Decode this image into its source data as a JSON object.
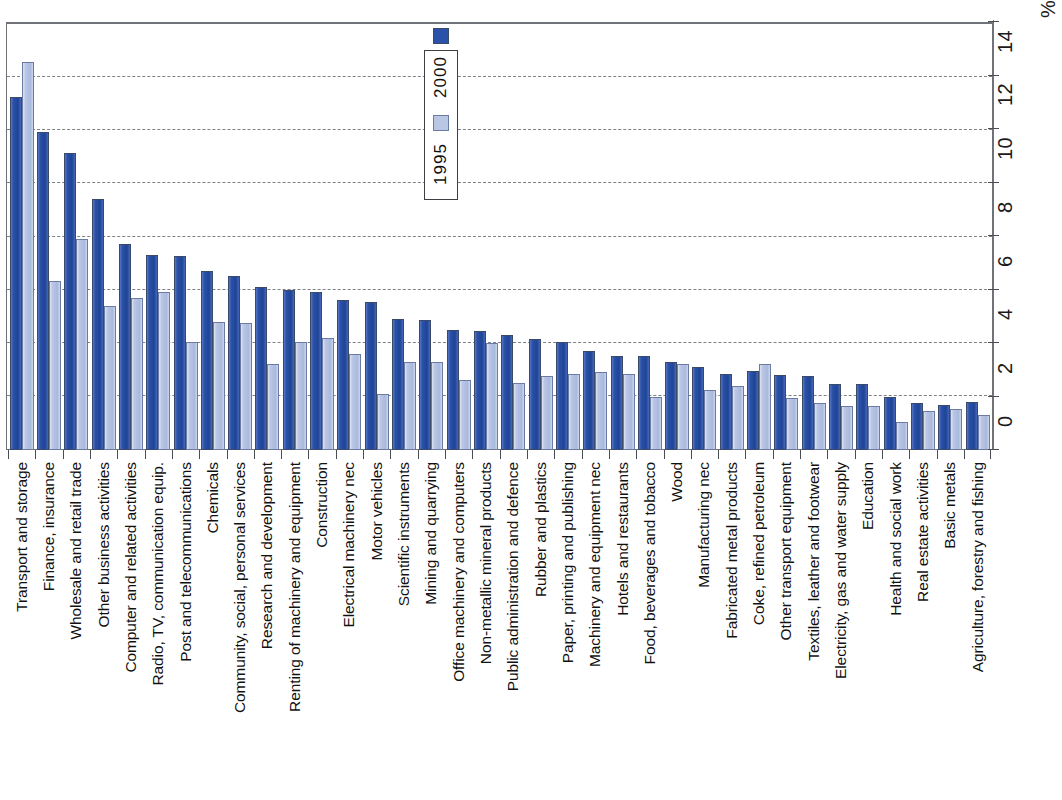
{
  "chart_data": {
    "type": "bar",
    "title": "",
    "subtitle": "",
    "xlabel": "",
    "ylabel": "%",
    "unit_label": "%",
    "ylim": [
      0,
      16
    ],
    "yticks": [
      0,
      2,
      4,
      6,
      8,
      10,
      12,
      14,
      16
    ],
    "grid": true,
    "grid_style": "dashed-horizontal",
    "orientation": "vertical-bars-rotated-labels",
    "legend": {
      "position": "top-center-inside",
      "entries": [
        {
          "name": "1995",
          "color": "#b9c6e4"
        },
        {
          "name": "2000",
          "color": "#2a52a8"
        }
      ]
    },
    "categories": [
      "Transport and storage",
      "Finance, insurance",
      "Wholesale and retail trade",
      "Other business activities",
      "Computer and related activities",
      "Radio, TV, communication equip.",
      "Post and telecommunications",
      "Chemicals",
      "Community, social, personal services",
      "Research and development",
      "Renting of machinery and equipment",
      "Construction",
      "Electrical machinery nec",
      "Motor vehicles",
      "Scientific instruments",
      "Mining and quarrying",
      "Office machinery and computers",
      "Non-metallic mineral products",
      "Public administration and defence",
      "Rubber and plastics",
      "Paper, printing and publishing",
      "Machinery and equipment nec",
      "Hotels and restaurants",
      "Food, beverages and tobacco",
      "Wood",
      "Manufacturing nec",
      "Fabricated metal products",
      "Coke, refined petroleum",
      "Other transport equipment",
      "Textiles, leather and footwear",
      "Electricity, gas and water supply",
      "Education",
      "Health and social work",
      "Real estate activities",
      "Basic metals",
      "Agriculture, forestry and fishing"
    ],
    "series": [
      {
        "name": "2000",
        "color": "#2a52a8",
        "values": [
          13.2,
          11.9,
          11.1,
          9.4,
          7.7,
          7.3,
          7.25,
          6.7,
          6.5,
          6.1,
          6.0,
          5.9,
          5.6,
          5.55,
          4.9,
          4.85,
          4.5,
          4.45,
          4.3,
          4.15,
          4.05,
          3.7,
          3.5,
          3.5,
          3.3,
          3.1,
          2.85,
          2.95,
          2.8,
          2.75,
          2.45,
          2.45,
          2.0,
          1.75,
          1.7,
          1.8
        ]
      },
      {
        "name": "1995",
        "color": "#b9c6e4",
        "values": [
          14.5,
          6.3,
          7.9,
          5.4,
          5.7,
          5.9,
          4.05,
          4.8,
          4.75,
          3.2,
          4.05,
          4.2,
          3.6,
          2.1,
          3.3,
          3.3,
          2.6,
          4.0,
          2.5,
          2.75,
          2.85,
          2.9,
          2.85,
          2.0,
          3.2,
          2.25,
          2.4,
          3.2,
          1.95,
          1.75,
          1.65,
          1.65,
          1.05,
          1.45,
          1.55,
          1.3
        ]
      }
    ]
  }
}
